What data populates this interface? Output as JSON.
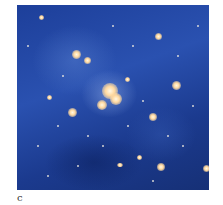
{
  "figure": {
    "panel_label": "c",
    "image_description": "Galaxy cluster in deep blue field with bright yellow-white central galaxies",
    "colors": {
      "background": "#2a51b0",
      "galaxy": "#ffd9a0"
    }
  }
}
